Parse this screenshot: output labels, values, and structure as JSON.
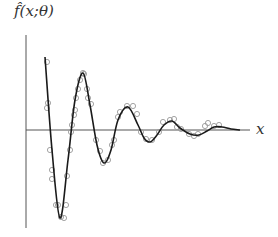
{
  "chart_data": {
    "type": "line",
    "title": "",
    "xlabel": "x",
    "ylabel": "f̂(x;θ)",
    "grid": false,
    "legend": null,
    "axes": {
      "y_axis": {
        "x": 26,
        "y_top": 35,
        "y_bottom": 228
      },
      "x_axis": {
        "y": 130,
        "x_left": 26,
        "x_right": 250
      }
    },
    "series": [
      {
        "name": "fitted curve",
        "style": "line",
        "color": "#1a1a1a",
        "x_px": [
          45,
          52,
          60,
          68,
          75,
          83,
          90,
          97,
          104,
          111,
          118,
          128,
          138,
          144,
          150,
          157,
          164,
          172,
          180,
          190,
          199,
          207,
          214,
          222,
          231,
          240
        ],
        "y_px": [
          57,
          150,
          218,
          160,
          100,
          73,
          105,
          145,
          163,
          150,
          120,
          107,
          125,
          138,
          142,
          135,
          125,
          121,
          128,
          134,
          135,
          131,
          127,
          127,
          129,
          130
        ]
      },
      {
        "name": "samples",
        "style": "scatter",
        "marker": "open-circle",
        "color": "#9a9a9a",
        "points_px": [
          [
            47,
            62
          ],
          [
            48,
            103
          ],
          [
            47,
            108
          ],
          [
            50,
            150
          ],
          [
            52,
            170
          ],
          [
            52,
            179
          ],
          [
            56,
            205
          ],
          [
            58,
            205
          ],
          [
            61,
            217
          ],
          [
            64,
            218
          ],
          [
            66,
            205
          ],
          [
            67,
            176
          ],
          [
            70,
            150
          ],
          [
            71,
            132
          ],
          [
            72,
            125
          ],
          [
            74,
            115
          ],
          [
            75,
            110
          ],
          [
            76,
            98
          ],
          [
            78,
            89
          ],
          [
            80,
            80
          ],
          [
            83,
            73
          ],
          [
            84,
            74
          ],
          [
            87,
            89
          ],
          [
            88,
            98
          ],
          [
            91,
            104
          ],
          [
            96,
            140
          ],
          [
            100,
            151
          ],
          [
            103,
            163
          ],
          [
            108,
            160
          ],
          [
            112,
            145
          ],
          [
            114,
            140
          ],
          [
            118,
            117
          ],
          [
            120,
            112
          ],
          [
            127,
            106
          ],
          [
            133,
            106
          ],
          [
            137,
            114
          ],
          [
            141,
            132
          ],
          [
            146,
            139
          ],
          [
            152,
            140
          ],
          [
            159,
            132
          ],
          [
            163,
            122
          ],
          [
            170,
            120
          ],
          [
            174,
            119
          ],
          [
            177,
            127
          ],
          [
            181,
            129
          ],
          [
            189,
            134
          ],
          [
            194,
            136
          ],
          [
            198,
            134
          ],
          [
            205,
            126
          ],
          [
            208,
            123
          ],
          [
            214,
            126
          ],
          [
            219,
            125
          ]
        ]
      }
    ]
  }
}
